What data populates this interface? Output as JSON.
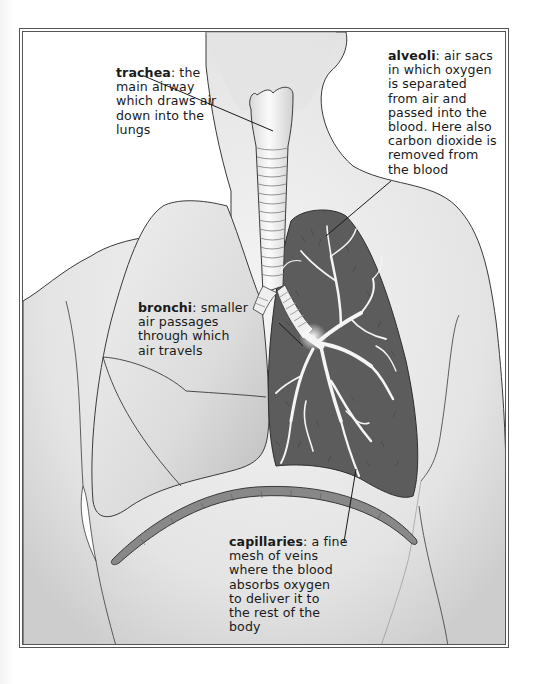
{
  "diagram": {
    "title": "",
    "colors": {
      "skin": "#e9e9e9",
      "skin_shadow": "#cfcfcf",
      "outline": "#3a3a3a",
      "lung_dark": "#5c5c5c",
      "lung_light": "#dedede",
      "airway": "#f4f4f4",
      "frame": "#555555"
    },
    "labels": [
      {
        "id": "trachea",
        "term": "trachea",
        "description": ": the main airway which draws air down into the lungs",
        "lines": [
          "main airway",
          "which draws air",
          "down into the",
          "lungs"
        ],
        "first_line_rest": ": the"
      },
      {
        "id": "alveoli",
        "term": "alveoli",
        "first_line_rest": ": air sacs",
        "lines": [
          "in which oxygen",
          "is separated",
          "from air and",
          "passed into the",
          "blood. Here also",
          "carbon dioxide is",
          "removed from",
          "the blood"
        ]
      },
      {
        "id": "bronchi",
        "term": "bronchi",
        "first_line_rest": ": smaller",
        "lines": [
          "air passages",
          "through which",
          "air travels"
        ]
      },
      {
        "id": "capillaries",
        "term": "capillaries",
        "first_line_rest": ": a fine",
        "lines": [
          "mesh of veins",
          "where the blood",
          "absorbs oxygen",
          "to deliver it to",
          "the rest of the",
          "body"
        ]
      }
    ],
    "parts": [
      "body-outline",
      "neck",
      "trachea",
      "bronchi",
      "left-lung",
      "right-lung",
      "bronchial-tree",
      "diaphragm"
    ]
  }
}
